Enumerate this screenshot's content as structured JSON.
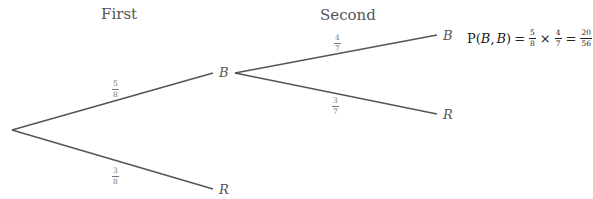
{
  "headers": {
    "first": "First",
    "second": "Second"
  },
  "nodes": {
    "first_b": "B",
    "first_r": "R",
    "second_b": "B",
    "second_r": "R"
  },
  "branches": {
    "root_to_b": {
      "num": "5",
      "den": "8"
    },
    "root_to_r": {
      "num": "3",
      "den": "8"
    },
    "b_to_b": {
      "num": "4",
      "den": "7"
    },
    "b_to_r": {
      "num": "3",
      "den": "7"
    }
  },
  "formula": {
    "p": "P",
    "open": "(",
    "arg1": "B",
    "comma": ",",
    "arg2": "B",
    "close": ")",
    "eq1": "=",
    "f1": {
      "num": "5",
      "den": "8"
    },
    "times": "×",
    "f2": {
      "num": "4",
      "den": "7"
    },
    "eq2": "=",
    "result": {
      "num": "20",
      "den": "56"
    }
  },
  "colors": {
    "line": "#555555",
    "label": "#777777",
    "formula": "#222222"
  }
}
